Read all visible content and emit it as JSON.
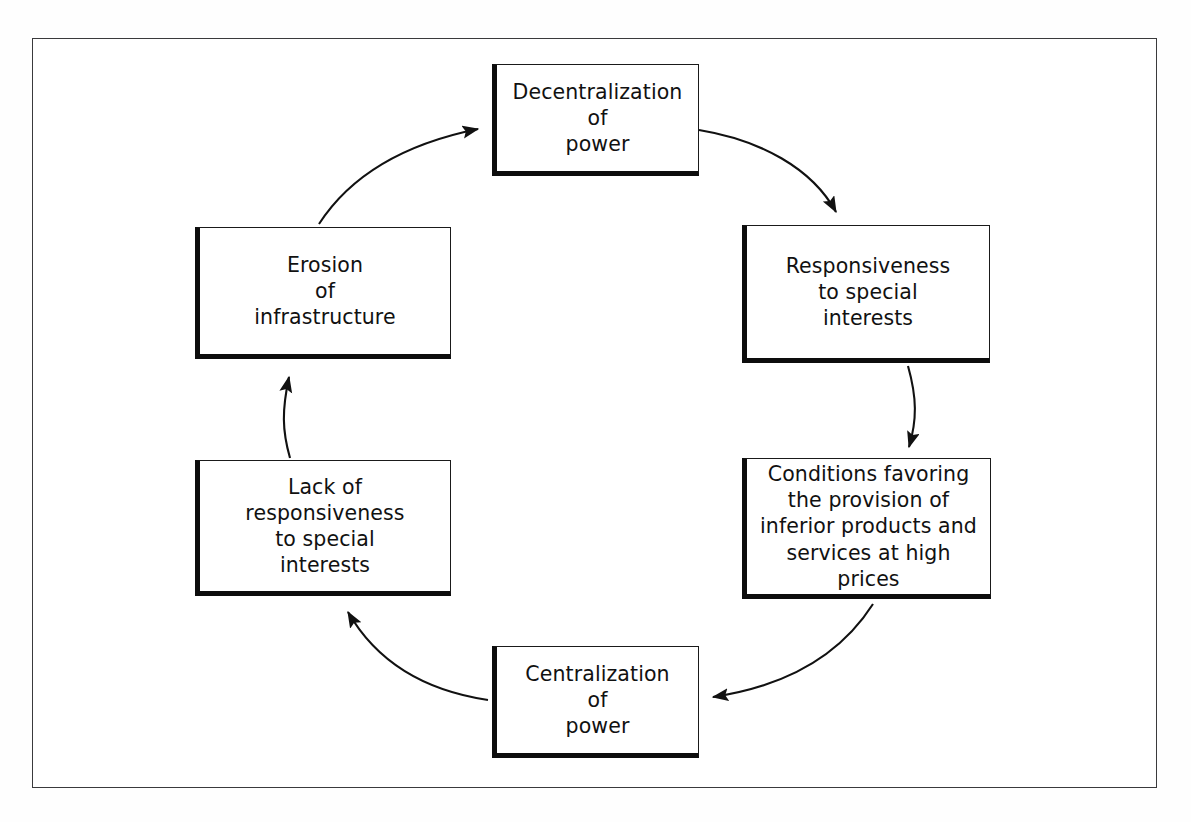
{
  "diagram": {
    "frame": {
      "border_color": "#3a3a3c"
    },
    "box_style": {
      "fill": "#ffffff",
      "border_color": "#1a1a1a",
      "shadow_color": "#0d0d0d"
    },
    "arrow_color": "#111111",
    "nodes": [
      {
        "id": "decentralization",
        "name": "decentralization-of-power",
        "lines": [
          "Decentralization",
          "of",
          "power"
        ],
        "text": "Decentralization\nof\npower"
      },
      {
        "id": "responsiveness",
        "name": "responsiveness-to-special-interests",
        "lines": [
          "Responsiveness",
          "to special",
          "interests"
        ],
        "text": "Responsiveness\nto special\ninterests"
      },
      {
        "id": "conditions",
        "name": "conditions-favoring-inferior-products",
        "lines": [
          "Conditions favoring",
          "the provision of",
          "inferior products and",
          "services at high prices"
        ],
        "text": "Conditions favoring\nthe provision of\ninferior products and\nservices at high prices"
      },
      {
        "id": "centralization",
        "name": "centralization-of-power",
        "lines": [
          "Centralization",
          "of",
          "power"
        ],
        "text": "Centralization\nof\npower"
      },
      {
        "id": "lack",
        "name": "lack-of-responsiveness-to-special-interests",
        "lines": [
          "Lack of",
          "responsiveness",
          "to special",
          "interests"
        ],
        "text": "Lack of\nresponsiveness\nto special\ninterests"
      },
      {
        "id": "erosion",
        "name": "erosion-of-infrastructure",
        "lines": [
          "Erosion",
          "of",
          "infrastructure"
        ],
        "text": "Erosion\nof\ninfrastructure"
      }
    ],
    "edges": [
      {
        "from": "decentralization",
        "to": "responsiveness",
        "direction": "clockwise"
      },
      {
        "from": "responsiveness",
        "to": "conditions",
        "direction": "clockwise"
      },
      {
        "from": "conditions",
        "to": "centralization",
        "direction": "clockwise"
      },
      {
        "from": "centralization",
        "to": "lack",
        "direction": "clockwise"
      },
      {
        "from": "lack",
        "to": "erosion",
        "direction": "clockwise"
      },
      {
        "from": "erosion",
        "to": "decentralization",
        "direction": "clockwise"
      }
    ]
  }
}
